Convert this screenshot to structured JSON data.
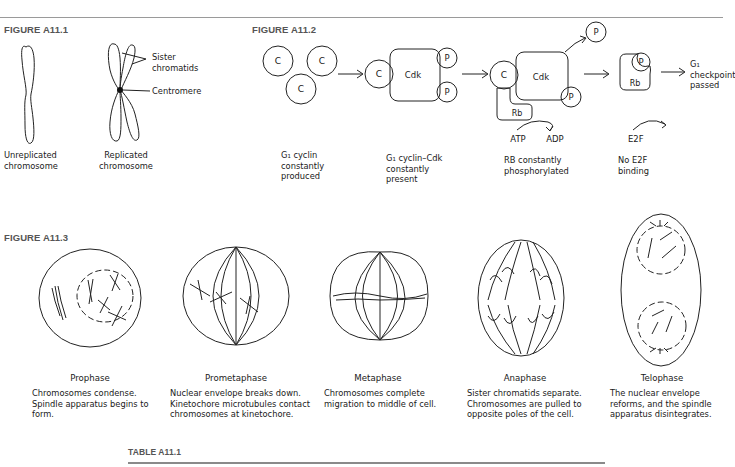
{
  "figure_a11_1": {
    "label": "FIGURE A11.1",
    "unreplicated_label": [
      "Unreplicated",
      "chromosome"
    ],
    "replicated_label": [
      "Replicated",
      "chromosome"
    ],
    "annotations": {
      "sister_chromatids": [
        "Sister",
        "chromatids"
      ],
      "centromere": "Centromere"
    }
  },
  "figure_a11_2": {
    "label": "FIGURE A11.2",
    "molecule_labels": {
      "cyclin": "C",
      "cdk": "Cdk",
      "phosphate": "P",
      "rb": "Rb",
      "atp": "ATP",
      "adp": "ADP",
      "e2f": "E2F"
    },
    "stages": [
      {
        "caption": [
          "G₁ cyclin",
          "constantly",
          "produced"
        ]
      },
      {
        "caption": [
          "G₁ cyclin–Cdk",
          "constantly",
          "present"
        ]
      },
      {
        "caption": [
          "RB constantly",
          "phosphorylated"
        ]
      },
      {
        "caption": [
          "No E2F",
          "binding"
        ]
      }
    ],
    "result_label": [
      "G₁",
      "checkpoint",
      "passed"
    ]
  },
  "figure_a11_3": {
    "label": "FIGURE A11.3",
    "phases": [
      {
        "name": "Prophase",
        "description": [
          "Chromosomes condense.",
          "Spindle apparatus begins to",
          "form."
        ]
      },
      {
        "name": "Prometaphase",
        "description": [
          "Nuclear envelope breaks down.",
          "Kinetochore microtubules contact",
          "chromosomes at kinetochore."
        ]
      },
      {
        "name": "Metaphase",
        "description": [
          "Chromosomes complete",
          "migration to middle of cell."
        ]
      },
      {
        "name": "Anaphase",
        "description": [
          "Sister chromatids separate.",
          "Chromosomes are pulled to",
          "opposite poles of the cell."
        ]
      },
      {
        "name": "Telophase",
        "description": [
          "The nuclear envelope",
          "reforms, and the spindle",
          "apparatus disintegrates."
        ]
      }
    ]
  },
  "table_a11_1": {
    "label": "TABLE A11.1"
  }
}
